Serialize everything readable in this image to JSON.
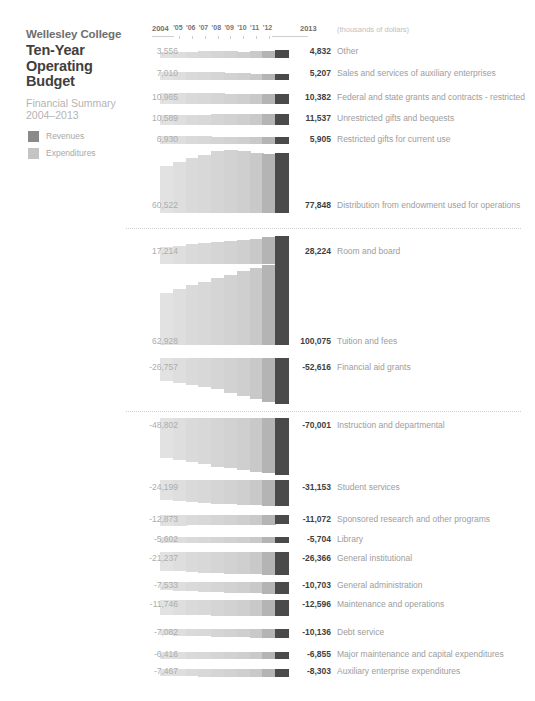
{
  "header": {
    "org": "Wellesley College",
    "title_line1": "Ten-Year",
    "title_line2": "Operating",
    "title_line3": "Budget",
    "subtitle_line1": "Financial Summary",
    "subtitle_line2": "2004–2013"
  },
  "legend": {
    "items": [
      {
        "label": "Revenues",
        "color": "#8a8a8a"
      },
      {
        "label": "Expenditures",
        "color": "#c4c4c4"
      }
    ]
  },
  "axis": {
    "start_year": "2004",
    "end_year": "2013",
    "mid_years": [
      "'05",
      "'06",
      "'07",
      "'08",
      "'09",
      "'10",
      "'11",
      "'12"
    ],
    "units": "(thousands of dollars)"
  },
  "chart_data": {
    "type": "bar",
    "title": "Wellesley College Ten-Year Operating Budget",
    "subtitle": "Financial Summary 2004–2013",
    "xlabel": "",
    "ylabel": "",
    "units": "thousands of dollars",
    "categories": [
      "2004",
      "2005",
      "2006",
      "2007",
      "2008",
      "2009",
      "2010",
      "2011",
      "2012",
      "2013"
    ],
    "legend": [
      "Revenues",
      "Expenditures"
    ],
    "legend_position": "top-left",
    "grid": false,
    "groups": [
      {
        "name": "Revenues",
        "series": [
          {
            "name": "Other",
            "start": 3556,
            "end": 4832,
            "values": [
              3556,
              3700,
              3900,
              4250,
              4500,
              4050,
              3850,
              4150,
              4500,
              4832
            ]
          },
          {
            "name": "Sales and services of auxiliary enterprises",
            "start": 7010,
            "end": 5207,
            "values": [
              7010,
              7050,
              7000,
              6900,
              6700,
              6300,
              5900,
              5600,
              5350,
              5207
            ]
          },
          {
            "name": "Federal and state grants and contracts - restricted",
            "start": 10965,
            "end": 10382,
            "values": [
              10965,
              11100,
              11050,
              10900,
              10700,
              10500,
              10450,
              10400,
              10390,
              10382
            ]
          },
          {
            "name": "Unrestricted gifts and bequests",
            "start": 10589,
            "end": 11537,
            "values": [
              10589,
              10700,
              10850,
              11000,
              11150,
              11250,
              11300,
              11400,
              11480,
              11537
            ]
          },
          {
            "name": "Restricted gifts for current use",
            "start": 6930,
            "end": 5905,
            "values": [
              6930,
              6800,
              6750,
              6600,
              6450,
              6300,
              6150,
              6050,
              5960,
              5905
            ]
          },
          {
            "name": "Distribution from endowment used for operations",
            "start": 60522,
            "end": 77848,
            "values": [
              60522,
              65800,
              70500,
              75200,
              79300,
              81200,
              79600,
              77000,
              76400,
              77848
            ]
          },
          {
            "name": "Room and board",
            "start": 17214,
            "end": 28224,
            "values": [
              17214,
              18400,
              19700,
              21000,
              22200,
              23300,
              24500,
              25700,
              26900,
              28224
            ]
          },
          {
            "name": "Tuition and fees",
            "start": 62928,
            "end": 100075,
            "values": [
              62928,
              67500,
              71800,
              76300,
              80600,
              84800,
              88800,
              92600,
              96300,
              100075
            ]
          },
          {
            "name": "Financial aid grants",
            "start": -26757,
            "end": -52616,
            "values": [
              -26757,
              -28600,
              -30500,
              -32800,
              -35200,
              -39500,
              -43500,
              -46600,
              -49800,
              -52616
            ]
          }
        ]
      },
      {
        "name": "Expenditures",
        "series": [
          {
            "name": "Instruction and departmental",
            "start": -48802,
            "end": -70001,
            "values": [
              -48802,
              -51500,
              -54200,
              -57000,
              -60200,
              -62000,
              -63800,
              -65900,
              -67900,
              -70001
            ]
          },
          {
            "name": "Student services",
            "start": -24199,
            "end": -31153,
            "values": [
              -24199,
              -25200,
              -26300,
              -27400,
              -28400,
              -28900,
              -29500,
              -30100,
              -30600,
              -31153
            ]
          },
          {
            "name": "Sponsored research and other programs",
            "start": -12873,
            "end": -11072,
            "values": [
              -12873,
              -12500,
              -12200,
              -11900,
              -11700,
              -11500,
              -11400,
              -11300,
              -11200,
              -11072
            ]
          },
          {
            "name": "Library",
            "start": -5602,
            "end": -5704,
            "values": [
              -5602,
              -5630,
              -5660,
              -5680,
              -5700,
              -5690,
              -5695,
              -5700,
              -5702,
              -5704
            ]
          },
          {
            "name": "General institutional",
            "start": -21237,
            "end": -26366,
            "values": [
              -21237,
              -22100,
              -22900,
              -23700,
              -24400,
              -24900,
              -25300,
              -25700,
              -26050,
              -26366
            ]
          },
          {
            "name": "General administration",
            "start": -7533,
            "end": -10703,
            "values": [
              -7533,
              -7900,
              -8300,
              -8700,
              -9100,
              -9500,
              -9850,
              -10200,
              -10450,
              -10703
            ]
          },
          {
            "name": "Maintenance and operations",
            "start": -11746,
            "end": -12596,
            "values": [
              -11746,
              -11900,
              -12050,
              -12150,
              -12250,
              -12350,
              -12430,
              -12500,
              -12550,
              -12596
            ]
          },
          {
            "name": "Debt service",
            "start": -7082,
            "end": -10136,
            "values": [
              -7082,
              -7400,
              -7800,
              -8200,
              -8600,
              -9000,
              -9400,
              -9700,
              -9950,
              -10136
            ]
          },
          {
            "name": "Major maintenance and capital expenditures",
            "start": -6416,
            "end": -6855,
            "values": [
              -6416,
              -6480,
              -6550,
              -6610,
              -6670,
              -6720,
              -6770,
              -6800,
              -6830,
              -6855
            ]
          },
          {
            "name": "Auxiliary enterprise expenditures",
            "start": -7467,
            "end": -8303,
            "values": [
              -7467,
              -7580,
              -7700,
              -7820,
              -7930,
              -8030,
              -8120,
              -8200,
              -8260,
              -8303
            ]
          }
        ]
      }
    ]
  },
  "rows": [
    {
      "left": "3,556",
      "right": "4,832",
      "label": "Other"
    },
    {
      "left": "7,010",
      "right": "5,207",
      "label": "Sales and services of auxiliary enterprises"
    },
    {
      "left": "10,965",
      "right": "10,382",
      "label": "Federal and state grants and contracts - restricted"
    },
    {
      "left": "10,589",
      "right": "11,537",
      "label": "Unrestricted gifts and bequests"
    },
    {
      "left": "6,930",
      "right": "5,905",
      "label": "Restricted gifts for current use"
    },
    {
      "left": "60,522",
      "right": "77,848",
      "label": "Distribution from endowment used for operations"
    },
    {
      "left": "17,214",
      "right": "28,224",
      "label": "Room and board"
    },
    {
      "left": "62,928",
      "right": "100,075",
      "label": "Tuition and fees"
    },
    {
      "left": "-26,757",
      "right": "-52,616",
      "label": "Financial aid grants"
    },
    {
      "left": "-48,802",
      "right": "-70,001",
      "label": "Instruction and departmental"
    },
    {
      "left": "-24,199",
      "right": "-31,153",
      "label": "Student services"
    },
    {
      "left": "-12,873",
      "right": "-11,072",
      "label": "Sponsored research and other programs"
    },
    {
      "left": "-5,602",
      "right": "-5,704",
      "label": "Library"
    },
    {
      "left": "-21,237",
      "right": "-26,366",
      "label": "General institutional"
    },
    {
      "left": "-7,533",
      "right": "-10,703",
      "label": "General administration"
    },
    {
      "left": "-11,746",
      "right": "-12,596",
      "label": "Maintenance and operations"
    },
    {
      "left": "-7,082",
      "right": "-10,136",
      "label": "Debt service"
    },
    {
      "left": "-6,416",
      "right": "-6,855",
      "label": "Major maintenance and capital expenditures"
    },
    {
      "left": "-7,467",
      "right": "-8,303",
      "label": "Auxiliary enterprise expenditures"
    }
  ],
  "layout": {
    "bar_left": 160,
    "bar_width": 128,
    "col_colors": [
      "#e2e2e2",
      "#dedede",
      "#dadada",
      "#d8d8d8",
      "#d5d5d5",
      "#d2d2d2",
      "#cfcfcf",
      "#c9c9c9",
      "#b4b4b4",
      "#4a4a4a"
    ],
    "rows_geom": [
      {
        "y": 50,
        "h": 8,
        "baseline": "bottom",
        "scale": 0.00175
      },
      {
        "y": 72,
        "h": 8,
        "baseline": "bottom",
        "scale": 0.0011
      },
      {
        "y": 93,
        "h": 11,
        "baseline": "bottom",
        "scale": 0.001
      },
      {
        "y": 114,
        "h": 11,
        "baseline": "bottom",
        "scale": 0.00098
      },
      {
        "y": 136,
        "h": 8,
        "baseline": "bottom",
        "scale": 0.0012
      },
      {
        "y": 150,
        "h": 63,
        "baseline": "bottom",
        "scale": 0.00081
      },
      {
        "y": 236,
        "h": 28,
        "baseline": "bottom",
        "scale": 0.00099
      },
      {
        "y": 262,
        "h": 83,
        "baseline": "bottom",
        "scale": 0.00083
      },
      {
        "y": 358,
        "h": 46,
        "baseline": "top",
        "scale": 0.00088
      },
      {
        "y": 418,
        "h": 57,
        "baseline": "top",
        "scale": 0.00081
      },
      {
        "y": 480,
        "h": 26,
        "baseline": "top",
        "scale": 0.00083
      },
      {
        "y": 515,
        "h": 11,
        "baseline": "top",
        "scale": 0.0009
      },
      {
        "y": 537,
        "h": 6,
        "baseline": "top",
        "scale": 0.00105
      },
      {
        "y": 552,
        "h": 23,
        "baseline": "top",
        "scale": 0.00087
      },
      {
        "y": 582,
        "h": 12,
        "baseline": "top",
        "scale": 0.00112
      },
      {
        "y": 600,
        "h": 16,
        "baseline": "top",
        "scale": 0.00127
      },
      {
        "y": 629,
        "h": 9,
        "baseline": "top",
        "scale": 0.00089
      },
      {
        "y": 652,
        "h": 7,
        "baseline": "top",
        "scale": 0.00102
      },
      {
        "y": 669,
        "h": 8,
        "baseline": "top",
        "scale": 0.00096
      }
    ],
    "label_y": [
      50,
      72,
      96,
      117,
      138,
      204,
      250,
      340,
      366,
      424,
      486,
      518,
      538,
      557,
      584,
      603,
      631,
      653,
      670
    ],
    "separators": [
      228,
      411
    ]
  }
}
